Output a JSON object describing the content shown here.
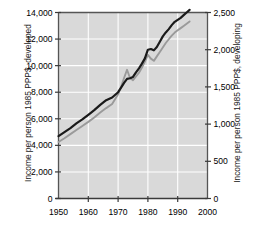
{
  "chart_data": {
    "type": "line",
    "title": "",
    "subtitle": "",
    "xlabel": "",
    "ylabel": "Income per person 1985 PPP$, developed",
    "ylabel_right": "Income per person 1985 PPP$, developing",
    "xlim": [
      1950,
      2000
    ],
    "ylim": [
      0,
      14000
    ],
    "ylim_right": [
      0,
      2500
    ],
    "grid": true,
    "legend_position": "inline-annotation",
    "plot_background": "#d9d9d9",
    "gridline_color": "#ffffff",
    "xticks": [
      1950,
      1960,
      1970,
      1980,
      1990,
      2000
    ],
    "xticklabels": [
      "1950",
      "1960",
      "1970",
      "1980",
      "1990",
      "2000"
    ],
    "yticks_left": [
      0,
      2000,
      4000,
      6000,
      8000,
      10000,
      12000,
      14000
    ],
    "yticklabels_left": [
      "0",
      "2,000",
      "4,000",
      "6,000",
      "8,000",
      "10,000",
      "12,000",
      "14,000"
    ],
    "yticks_right": [
      0,
      500,
      1000,
      1500,
      2000,
      2500
    ],
    "yticklabels_right": [
      "0",
      "500",
      "1,000",
      "1,500",
      "2,000",
      "2,500"
    ],
    "series": [
      {
        "name": "Developed countries",
        "color": "#1a1a1a",
        "axis": "left",
        "annotation": {
          "line1": "Developed",
          "line2": "countries"
        },
        "x": [
          1950,
          1952,
          1954,
          1956,
          1958,
          1960,
          1962,
          1964,
          1966,
          1968,
          1970,
          1971,
          1972,
          1973,
          1974,
          1975,
          1976,
          1977,
          1978,
          1979,
          1980,
          1981,
          1982,
          1983,
          1984,
          1985,
          1986,
          1987,
          1988,
          1989,
          1990,
          1991,
          1992,
          1993,
          1994
        ],
        "values": [
          4700,
          5000,
          5300,
          5650,
          5950,
          6300,
          6650,
          7050,
          7400,
          7600,
          8000,
          8350,
          8700,
          9000,
          9050,
          9150,
          9500,
          9800,
          10150,
          10550,
          11200,
          11250,
          11150,
          11400,
          11800,
          12200,
          12500,
          12750,
          13050,
          13300,
          13450,
          13600,
          13800,
          14000,
          14200
        ]
      },
      {
        "name": "Developing countries",
        "color": "#9a9a9a",
        "axis": "right",
        "annotation": {
          "line1": "Developing",
          "line2": "countries"
        },
        "x": [
          1950,
          1952,
          1954,
          1956,
          1958,
          1960,
          1962,
          1964,
          1966,
          1968,
          1970,
          1971,
          1972,
          1973,
          1974,
          1975,
          1976,
          1977,
          1978,
          1979,
          1980,
          1981,
          1982,
          1983,
          1984,
          1985,
          1986,
          1987,
          1988,
          1989,
          1990,
          1991,
          1992,
          1993,
          1994
        ],
        "values": [
          760,
          810,
          865,
          920,
          975,
          1030,
          1090,
          1155,
          1215,
          1270,
          1400,
          1500,
          1620,
          1730,
          1620,
          1590,
          1640,
          1690,
          1760,
          1840,
          1930,
          1880,
          1850,
          1910,
          1970,
          2030,
          2090,
          2140,
          2190,
          2230,
          2260,
          2290,
          2320,
          2350,
          2380
        ]
      }
    ]
  },
  "annotations": {
    "developing": {
      "line1": "Developing",
      "line2": "countries"
    },
    "developed": {
      "line1": "Developed",
      "line2": "countries"
    }
  }
}
